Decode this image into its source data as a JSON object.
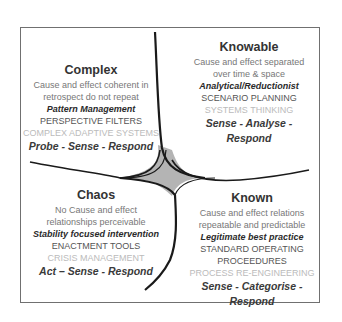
{
  "diagram": {
    "type": "cynefin-framework",
    "colors": {
      "frame": "#707070",
      "curve": "#1a1a1a",
      "center_fill": "#b4b4b4",
      "title": "#333333",
      "description": "#777777",
      "practice": "#2a2a2a",
      "tool": "#555555",
      "system": "#bbbbbb",
      "action": "#3a3a3a"
    },
    "quadrants": {
      "complex": {
        "title": "Complex",
        "description": [
          "Cause and effect coherent in",
          "retrospect do not repeat"
        ],
        "practice": "Pattern Management",
        "tools": [
          "PERSPECTIVE FILTERS"
        ],
        "system": "COMPLEX ADAPTIVE SYSTEMS",
        "action": "Probe - Sense - Respond"
      },
      "knowable": {
        "title": "Knowable",
        "description": [
          "Cause and effect separated",
          "over time & space"
        ],
        "practice": "Analytical/Reductionist",
        "tools": [
          "SCENARIO PLANNING"
        ],
        "system": "SYSTEMS THINKING",
        "action": "Sense - Analyse - Respond"
      },
      "chaos": {
        "title": "Chaos",
        "description": [
          "No Cause and effect",
          "relationships perceivable"
        ],
        "practice": "Stability focused intervention",
        "tools": [
          "ENACTMENT TOOLS"
        ],
        "system": "CRISIS MANAGEMENT",
        "action": "Act – Sense - Respond"
      },
      "known": {
        "title": "Known",
        "description": [
          "Cause and effect relations",
          "repeatable and predictable"
        ],
        "practice": "Legitimate best practice",
        "tools": [
          "STANDARD OPERATING",
          "PROCEEDURES"
        ],
        "system": "PROCESS RE-ENGINEERING",
        "action": "Sense - Categorise - Respond"
      }
    }
  }
}
